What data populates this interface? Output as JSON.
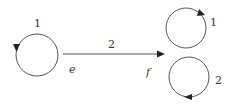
{
  "diagram": {
    "left_loop": {
      "label": "1",
      "arrow_direction": "down"
    },
    "edge": {
      "label": "2",
      "start_label": "e",
      "end_label": "f"
    },
    "right_loops": [
      {
        "label": "1",
        "arrow_direction": "clockwise"
      },
      {
        "label": "2",
        "arrow_direction": "clockwise"
      }
    ],
    "colors": {
      "stroke": "#555555",
      "text": "#333333",
      "arrowhead": "#222222"
    }
  }
}
